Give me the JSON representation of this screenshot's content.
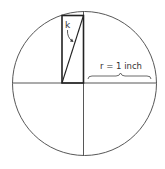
{
  "diagram": {
    "type": "geometry",
    "angle_label": "k",
    "radius_label": "r = 1 inch",
    "colors": {
      "stroke": "#333333",
      "background": "#ffffff"
    }
  }
}
